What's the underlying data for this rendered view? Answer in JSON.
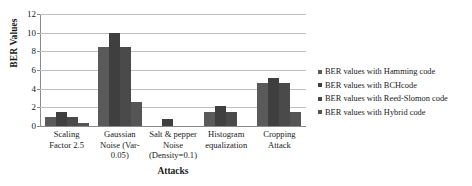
{
  "chart_data": {
    "type": "bar",
    "title": "",
    "xlabel": "Attacks",
    "ylabel": "BER Values",
    "ylim": [
      0,
      12
    ],
    "yticks": [
      0,
      2,
      4,
      6,
      8,
      10,
      12
    ],
    "grid": true,
    "legend_position": "right",
    "categories": [
      "Scaling Factor 2.5",
      "Gaussian Noise (Var-0.05)",
      "Salt & pepper Noise (Density=0.1)",
      "Histogram equalization",
      "Cropping Attack"
    ],
    "series": [
      {
        "name": "BER values with Hamming code",
        "color": "#5a5a5a",
        "values": [
          1.0,
          8.5,
          0.0,
          1.5,
          4.6
        ]
      },
      {
        "name": "BER values with BCHcode",
        "color": "#3f3f3f",
        "values": [
          1.5,
          10.0,
          0.7,
          2.15,
          5.1
        ]
      },
      {
        "name": "BER values with Reed-Slomon code",
        "color": "#4a4a4a",
        "values": [
          1.0,
          8.5,
          0.0,
          1.5,
          4.6
        ]
      },
      {
        "name": "BER values with Hybrid code",
        "color": "#555555",
        "values": [
          0.3,
          2.6,
          0.0,
          0.0,
          1.5
        ]
      }
    ]
  },
  "axis": {
    "y_title": "BER Values",
    "x_title": "Attacks",
    "y_tick_labels": [
      "12",
      "10",
      "8",
      "6",
      "4",
      "2",
      "0"
    ]
  },
  "x_category_lines": [
    [
      "Scaling",
      "Factor 2.5"
    ],
    [
      "Gaussian",
      "Noise (Var-",
      "0.05)"
    ],
    [
      "Salt & pepper",
      "Noise",
      "(Density=0.1)"
    ],
    [
      "Histogram",
      "equalization"
    ],
    [
      "Cropping",
      "Attack"
    ]
  ],
  "legend": {
    "items": [
      "BER values with Hamming code",
      "BER values with BCHcode",
      "BER values with Reed-Slomon code",
      "BER values with Hybrid code"
    ]
  }
}
